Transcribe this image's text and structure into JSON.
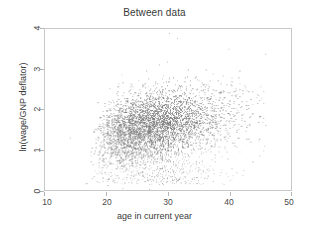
{
  "chart_data": {
    "type": "scatter",
    "title": "Between data",
    "xlabel": "age in current year",
    "ylabel": "ln(wage/GNP deflator)",
    "xlim": [
      10,
      50
    ],
    "ylim": [
      0,
      4
    ],
    "xticks": [
      10,
      20,
      30,
      40,
      50
    ],
    "xticklabels": [
      "10",
      "20",
      "30",
      "40",
      "50"
    ],
    "yticks": [
      0,
      1,
      2,
      3,
      4
    ],
    "yticklabels": [
      "0",
      "1",
      "2",
      "3",
      "4"
    ],
    "grid": false,
    "legend": null,
    "marker": {
      "shape": "point",
      "size_px": 1,
      "color": "#6e6e6e",
      "opacity": 0.55
    },
    "n_points": 4700,
    "distribution": {
      "x_mean": 28.2,
      "x_sd": 5.3,
      "x_min": 16.0,
      "x_max": 46.0,
      "y_mean": 1.62,
      "y_sd": 0.44,
      "y_min": 0.0,
      "y_max": 3.92,
      "correlation": 0.33
    },
    "outliers": [
      {
        "x": 30.2,
        "y": 3.9
      },
      {
        "x": 31.4,
        "y": 3.78
      },
      {
        "x": 39.9,
        "y": 3.5
      },
      {
        "x": 29.8,
        "y": 3.18
      },
      {
        "x": 22.5,
        "y": 0.06
      },
      {
        "x": 26.9,
        "y": 0.02
      },
      {
        "x": 17.6,
        "y": 0.3
      },
      {
        "x": 14.1,
        "y": 1.31
      }
    ],
    "colors": {
      "background": "#ffffff",
      "frame": "#c8c8c8",
      "text": "#3a3a3a",
      "tick": "#b4b4b4",
      "points": "#6e6e6e"
    }
  }
}
